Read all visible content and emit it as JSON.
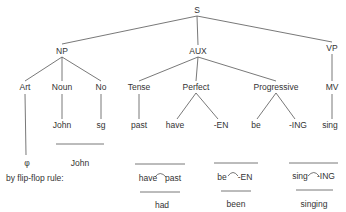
{
  "tree": {
    "root": "S",
    "level1": {
      "np": "NP",
      "aux": "AUX",
      "vp": "VP"
    },
    "level2": {
      "art": "Art",
      "noun": "Noun",
      "no": "No",
      "tense": "Tense",
      "perfect": "Perfect",
      "progressive": "Progressive",
      "mv": "MV"
    },
    "level3": {
      "john": "John",
      "sg": "sg",
      "past": "past",
      "have": "have",
      "en": "-EN",
      "be": "be",
      "ing": "-ING",
      "sing": "sing"
    }
  },
  "derivation": {
    "art_result": "φ",
    "np_result": "John",
    "rule_label": "by flip-flop rule:",
    "pairs": [
      {
        "left": "have",
        "right": "past",
        "result": "had"
      },
      {
        "left": "be",
        "right": "-EN",
        "result": "been"
      },
      {
        "left": "sing",
        "right": "-ING",
        "result": "singing"
      }
    ]
  },
  "colors": {
    "line": "#555555",
    "text": "#333333"
  }
}
